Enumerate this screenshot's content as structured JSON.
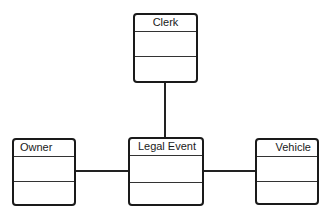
{
  "diagram": {
    "type": "UML class diagram",
    "classes": [
      {
        "id": "clerk",
        "name": "Clerk",
        "attributes": [],
        "operations": []
      },
      {
        "id": "owner",
        "name": "Owner",
        "attributes": [],
        "operations": []
      },
      {
        "id": "legal_event",
        "name": "Legal Event",
        "attributes": [],
        "operations": []
      },
      {
        "id": "vehicle",
        "name": "Vehicle",
        "attributes": [],
        "operations": []
      }
    ],
    "associations": [
      {
        "from": "Clerk",
        "to": "Legal Event"
      },
      {
        "from": "Owner",
        "to": "Legal Event"
      },
      {
        "from": "Legal Event",
        "to": "Vehicle"
      }
    ],
    "colors": {
      "line": "#1a1a1a",
      "background": "#ffffff"
    }
  }
}
